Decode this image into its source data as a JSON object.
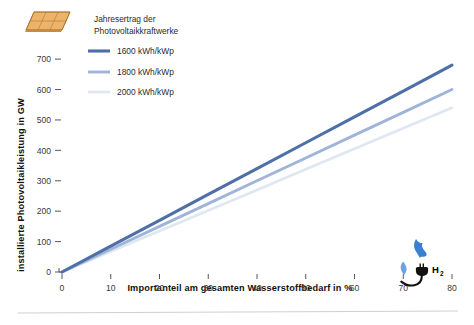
{
  "chart_data": {
    "type": "line",
    "title": "",
    "xlabel": "Importanteil am gesamten Wasserstoffbedarf in %",
    "ylabel": "installierte Photovoltaikleistung in GW",
    "xlim": [
      0,
      80
    ],
    "ylim": [
      0,
      730
    ],
    "xticks": [
      0,
      10,
      20,
      30,
      40,
      50,
      60,
      70,
      80
    ],
    "yticks": [
      0,
      100,
      200,
      300,
      400,
      500,
      600,
      700
    ],
    "xtick_labels": [
      "0",
      "10",
      "20",
      "30",
      "40",
      "50",
      "60",
      "70",
      "80"
    ],
    "ytick_labels": [
      "0",
      "100",
      "200",
      "300",
      "400",
      "500",
      "600",
      "700"
    ],
    "grid": false,
    "legend_position": "top-left",
    "legend_title": "Jahresertrag der Photovoltaikkraftwerke",
    "x": [
      0,
      10,
      20,
      30,
      40,
      50,
      60,
      70,
      80
    ],
    "series": [
      {
        "name": "1600 kWh/kWp",
        "color": "#4f6fa8",
        "width": 3.1,
        "values": [
          0,
          85,
          170,
          255,
          340,
          425,
          510,
          595,
          680
        ]
      },
      {
        "name": "1800 kWh/kWp",
        "color": "#9fb4d8",
        "width": 2.9,
        "values": [
          0,
          75,
          150,
          225,
          300,
          375,
          450,
          525,
          600
        ]
      },
      {
        "name": "2000 kWh/kWp",
        "color": "#dfe7f3",
        "width": 2.7,
        "values": [
          0,
          67.5,
          135,
          202.5,
          270,
          337.5,
          405,
          472.5,
          540
        ]
      }
    ]
  },
  "legend": {
    "title_line1": "Jahresertrag der",
    "title_line2": "Photovoltaikkraftwerke",
    "entries": [
      {
        "label": "1600 kWh/kWp",
        "color": "#4f6fa8"
      },
      {
        "label": "1800 kWh/kWp",
        "color": "#9fb4d8"
      },
      {
        "label": "2000 kWh/kWp",
        "color": "#dfe7f3"
      }
    ]
  },
  "icons": {
    "solar_panel": "solar-panel-icon",
    "hydrogen": "hydrogen-plug-icon",
    "hydrogen_label": "H",
    "hydrogen_subscript": "2"
  },
  "colors": {
    "series_1600": "#4f6fa8",
    "series_1800": "#9fb4d8",
    "series_2000": "#dfe7f3",
    "panel_fill": "#e8a957",
    "flame": "#3b7fd4",
    "droplet": "#6fa3e0",
    "axis": "#55565a",
    "text": "#1b1b1b",
    "background": "#ffffff"
  }
}
